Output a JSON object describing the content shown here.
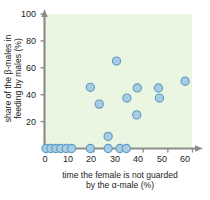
{
  "chart_data": {
    "type": "scatter",
    "title": "",
    "xlabel": "time the female is not guarded by the α-male (%)",
    "xlabel_line1": "time the female is not guarded",
    "xlabel_line2": "by the α-male (%)",
    "ylabel": "share of the β-males in feeding by males (%)",
    "ylabel_line1": "share of the β-males in",
    "ylabel_line2": "feeding by males (%)",
    "xlim": [
      0,
      60
    ],
    "ylim": [
      0,
      100
    ],
    "xticks": [
      0,
      10,
      20,
      30,
      40,
      50,
      60
    ],
    "yticks": [
      20,
      40,
      60,
      80,
      100
    ],
    "xtick_labels": [
      "0",
      "10",
      "20",
      "30",
      "40",
      "50",
      "60"
    ],
    "ytick_labels": [
      "20",
      "40",
      "60",
      "80",
      "100"
    ],
    "grid": false,
    "legend": null,
    "marker_fill": "#a8cde2",
    "marker_edge": "#5b9bc4",
    "plot_background": "#eaf6e1",
    "axis_color": "#8a8a8a",
    "points": [
      {
        "x": 0.6,
        "y": 0
      },
      {
        "x": 2.6,
        "y": 0
      },
      {
        "x": 4.6,
        "y": 0
      },
      {
        "x": 6.6,
        "y": 0
      },
      {
        "x": 8.8,
        "y": 0
      },
      {
        "x": 11.0,
        "y": 0
      },
      {
        "x": 18.6,
        "y": 0
      },
      {
        "x": 25.8,
        "y": 0
      },
      {
        "x": 30.6,
        "y": 0
      },
      {
        "x": 33.2,
        "y": 0
      },
      {
        "x": 25.8,
        "y": 9
      },
      {
        "x": 18.6,
        "y": 45.5
      },
      {
        "x": 22.2,
        "y": 33
      },
      {
        "x": 29.2,
        "y": 65
      },
      {
        "x": 33.4,
        "y": 37.5
      },
      {
        "x": 37.4,
        "y": 25
      },
      {
        "x": 37.6,
        "y": 45
      },
      {
        "x": 46.2,
        "y": 45
      },
      {
        "x": 46.6,
        "y": 37.5
      },
      {
        "x": 57.0,
        "y": 50
      }
    ]
  },
  "axes": {
    "y_labels": [
      {
        "value": "100",
        "top": 10
      },
      {
        "value": "80",
        "top": 37
      },
      {
        "value": "60",
        "top": 64
      },
      {
        "value": "40",
        "top": 91
      },
      {
        "value": "20",
        "top": 118
      }
    ],
    "x_labels": [
      {
        "value": "0",
        "left": 35
      },
      {
        "value": "10",
        "left": 58
      },
      {
        "value": "20",
        "left": 81
      },
      {
        "value": "30",
        "left": 105
      },
      {
        "value": "40",
        "left": 128
      },
      {
        "value": "50",
        "left": 152
      },
      {
        "value": "60",
        "left": 175
      }
    ]
  }
}
